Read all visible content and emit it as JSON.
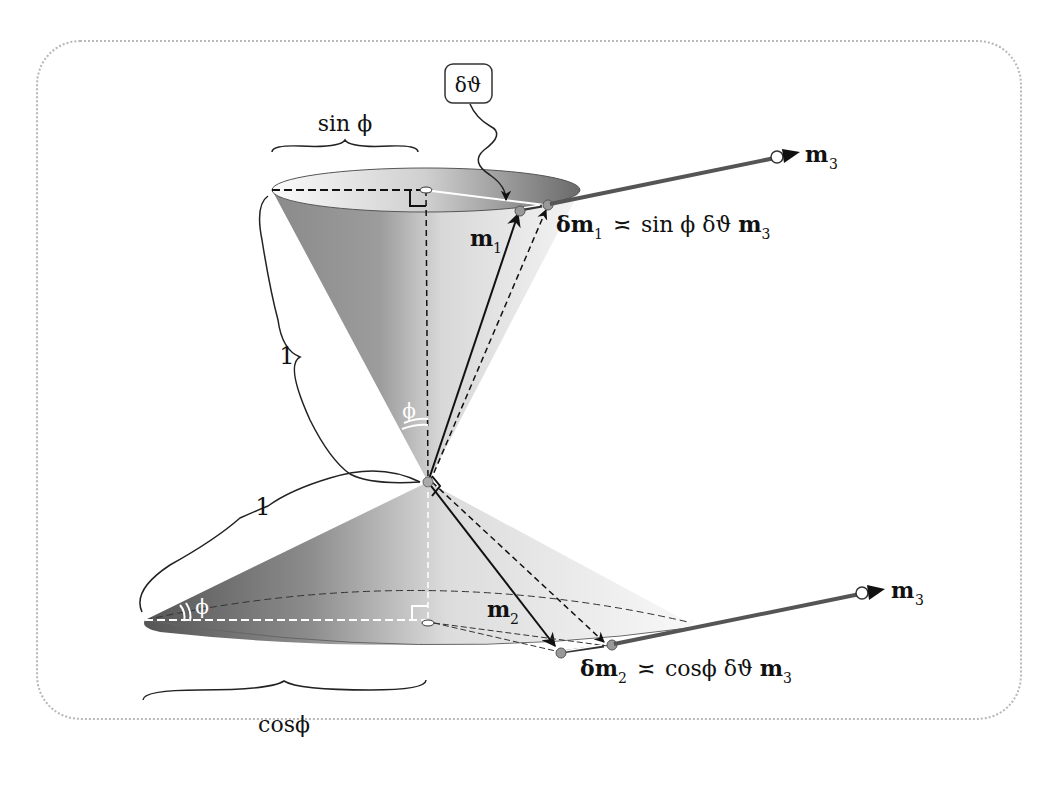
{
  "figure": {
    "labels": {
      "delta_theta_box": "δϑ",
      "sin_phi": "sin ϕ",
      "cos_phi": "cosϕ",
      "one_upper": "1",
      "one_lower": "1",
      "phi_upper": "ϕ",
      "phi_lower": "ϕ",
      "m1": "m",
      "m1_sub": "1",
      "m2": "m",
      "m2_sub": "2",
      "m3_upper": "m",
      "m3_upper_sub": "3",
      "m3_lower": "m",
      "m3_lower_sub": "3",
      "dm1_eq": {
        "lhs": "δm",
        "lhs_sub": "1",
        "rel": "≍",
        "rhs": "sin ϕ δϑ ",
        "rhs_m": "m",
        "rhs_sub": "3"
      },
      "dm2_eq": {
        "lhs": "δm",
        "lhs_sub": "2",
        "rel": "≍",
        "rhs": "cosϕ δϑ ",
        "rhs_m": "m",
        "rhs_sub": "3"
      }
    },
    "colors": {
      "frame_border": "#b8b8b8",
      "cone_dark": "#555555",
      "cone_light": "#f2f2f2",
      "ink": "#111111"
    }
  },
  "caption": ""
}
